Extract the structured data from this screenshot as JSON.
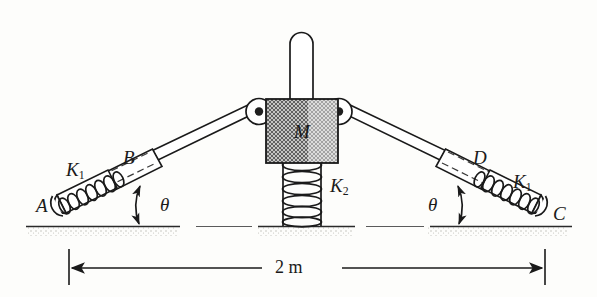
{
  "figure": {
    "background_color": "#fdfdfb",
    "ink_color": "#1a1a1a"
  },
  "labels": {
    "mass": "M",
    "point_a": "A",
    "point_b": "B",
    "point_c": "C",
    "point_d": "D",
    "spring_left": "K",
    "spring_left_sub": "1",
    "spring_right": "K",
    "spring_right_sub": "1",
    "spring_center": "K",
    "spring_center_sub": "2",
    "angle_left": "θ",
    "angle_right": "θ",
    "dimension": "2 m"
  },
  "components": {
    "mass_block": {
      "name": "M",
      "fill": "crosshatch",
      "shape": "rectangle"
    },
    "vertical_rod": {
      "name": "guide-rod",
      "cap": "rounded"
    },
    "center_spring": {
      "name": "K2",
      "orientation": "vertical",
      "coils": 8
    },
    "left_link": {
      "pivot_top": "mass-left-pin",
      "pivot_ground": "A",
      "sleeve_label": "B",
      "spring_label": "K1",
      "coils": 7
    },
    "right_link": {
      "pivot_top": "mass-right-pin",
      "pivot_ground": "C",
      "sleeve_label": "D",
      "spring_label": "K1",
      "coils": 7
    },
    "ground": {
      "name": "ground-line",
      "style": "hatched"
    },
    "dimension_line": {
      "value": "2 m",
      "arrows": "both"
    }
  },
  "colors": {
    "ink": "#1a1a1a",
    "hatch": "#4a4a4a",
    "ground_shade": "#c9c9c4",
    "paper": "#fdfdfb"
  }
}
